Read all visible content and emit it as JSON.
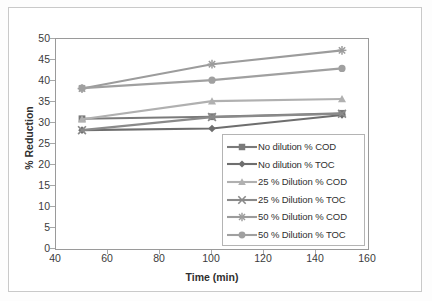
{
  "chart_data": {
    "type": "line",
    "title": "",
    "xlabel": "Time (min)",
    "ylabel": "% Reduction",
    "xlim": [
      40,
      160
    ],
    "ylim": [
      0,
      50
    ],
    "xticks": [
      40,
      60,
      80,
      100,
      120,
      140,
      160
    ],
    "yticks": [
      0,
      5,
      10,
      15,
      20,
      25,
      30,
      35,
      40,
      45,
      50
    ],
    "grid": false,
    "legend_position": "inside-lower-right",
    "x": [
      50,
      100,
      150
    ],
    "series": [
      {
        "name": "No dilution % COD",
        "marker": "square",
        "color": "#7a7a7a",
        "values": [
          31.0,
          31.5,
          32.3
        ]
      },
      {
        "name": "No dilution % TOC",
        "marker": "diamond",
        "color": "#6e6e6e",
        "values": [
          28.3,
          28.7,
          31.9
        ]
      },
      {
        "name": "25 % Dilution % COD",
        "marker": "triangle",
        "color": "#b0b0b0",
        "values": [
          30.9,
          35.2,
          35.7
        ]
      },
      {
        "name": "25 % Dilution % TOC",
        "marker": "cross",
        "color": "#8a8a8a",
        "values": [
          28.3,
          31.4,
          32.2
        ]
      },
      {
        "name": "50 % Dilution % COD",
        "marker": "asterisk",
        "color": "#9c9c9c",
        "values": [
          38.2,
          44.0,
          47.3
        ]
      },
      {
        "name": "50 % Dilution % TOC",
        "marker": "circle",
        "color": "#a0a0a0",
        "values": [
          38.3,
          40.2,
          43.0
        ]
      }
    ]
  },
  "axis": {
    "y_title": "% Reduction",
    "x_title": "Time (min)",
    "y_tick_labels": [
      "50",
      "45",
      "40",
      "35",
      "30",
      "25",
      "20",
      "15",
      "10",
      "5",
      "0"
    ],
    "x_tick_labels": [
      "40",
      "60",
      "80",
      "100",
      "120",
      "140",
      "160"
    ]
  },
  "legend": {
    "items": [
      {
        "label": "No dilution % COD",
        "marker": "square"
      },
      {
        "label": "No dilution % TOC",
        "marker": "diamond"
      },
      {
        "label": "25 % Dilution % COD",
        "marker": "triangle"
      },
      {
        "label": "25 % Dilution % TOC",
        "marker": "cross"
      },
      {
        "label": "50 % Dilution % COD",
        "marker": "asterisk"
      },
      {
        "label": "50 % Dilution % TOC",
        "marker": "circle"
      }
    ]
  }
}
